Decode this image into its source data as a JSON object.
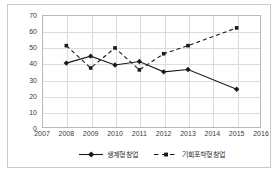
{
  "chart_data": {
    "type": "line",
    "title": "",
    "xlabel": "",
    "ylabel": "",
    "x": [
      2007,
      2008,
      2009,
      2010,
      2011,
      2012,
      2013,
      2014,
      2015,
      2016
    ],
    "xticklabels": [
      "2007",
      "2008",
      "2009",
      "2010",
      "2011",
      "2012",
      "2013",
      "2014",
      "2015",
      "2016"
    ],
    "xlim": [
      2007,
      2016
    ],
    "ylim": [
      0,
      70
    ],
    "yticks": [
      0,
      10,
      20,
      30,
      40,
      50,
      60,
      70
    ],
    "yticklabels": [
      "0",
      "10",
      "20",
      "30",
      "40",
      "50",
      "60",
      "70"
    ],
    "grid": true,
    "legend_position": "bottom-center",
    "series": [
      {
        "name": "생계형 창업",
        "line_style": "solid",
        "marker": "diamond",
        "color": "#1a1a1a",
        "x": [
          2008,
          2009,
          2010,
          2011,
          2012,
          2013,
          2015
        ],
        "values": [
          40.2,
          44.5,
          39.0,
          41.2,
          34.8,
          36.2,
          24.0
        ]
      },
      {
        "name": "기회포착형 창업",
        "line_style": "dashed",
        "marker": "square",
        "color": "#1a1a1a",
        "x": [
          2008,
          2009,
          2010,
          2011,
          2012,
          2013,
          2015
        ],
        "values": [
          51.0,
          37.2,
          49.6,
          36.0,
          46.0,
          51.0,
          62.0
        ]
      }
    ]
  },
  "legend": {
    "items": [
      {
        "label": "생계형 창업"
      },
      {
        "label": "기회포착형 창업"
      }
    ]
  }
}
